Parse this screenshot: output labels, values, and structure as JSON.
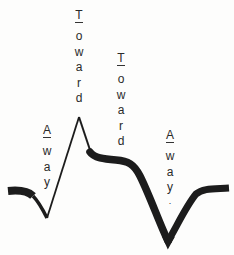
{
  "diagram": {
    "type": "waveform",
    "stroke_color": "#1c1c1c",
    "labels": [
      {
        "id": "toward-1",
        "text": "Toward",
        "x": 72,
        "y": 9
      },
      {
        "id": "toward-2",
        "text": "Toward",
        "x": 114,
        "y": 52
      },
      {
        "id": "away-1",
        "text": "Away",
        "x": 40,
        "y": 124
      },
      {
        "id": "away-2",
        "text": "Away",
        "x": 163,
        "y": 129
      }
    ],
    "away_1": {
      "text": "Away",
      "chars": [
        "A",
        "w",
        "a",
        "y"
      ]
    },
    "toward_1": {
      "text": "Toward",
      "chars": [
        "T",
        "o",
        "w",
        "a",
        "r",
        "d"
      ]
    },
    "toward_2": {
      "text": "Toward",
      "chars": [
        "T",
        "o",
        "w",
        "a",
        "r",
        "d"
      ]
    },
    "away_2": {
      "text": "Away",
      "chars": [
        "A",
        "w",
        "a",
        "y"
      ],
      "trailing_mark": "."
    }
  }
}
